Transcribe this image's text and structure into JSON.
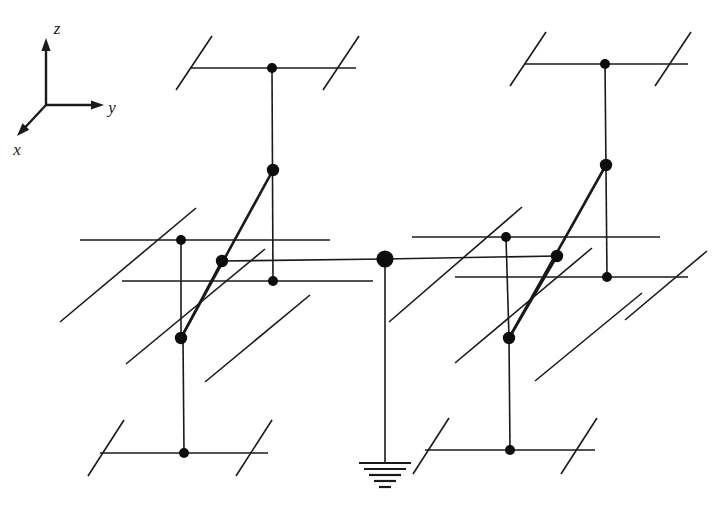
{
  "figure": {
    "kind": "crystal-lattice-diagram",
    "background_color": "#ffffff",
    "line_color": "#1a1a1a",
    "node_color": "#0d0d0d",
    "width": 723,
    "height": 508
  },
  "axes": {
    "origin": {
      "x": 46,
      "y": 105
    },
    "items": [
      {
        "name": "z",
        "label": "z",
        "tip": {
          "x": 46,
          "y": 38
        },
        "label_pos": {
          "x": 57,
          "y": 34
        }
      },
      {
        "name": "y",
        "label": "y",
        "tip": {
          "x": 104,
          "y": 105
        },
        "label_pos": {
          "x": 112,
          "y": 113
        }
      },
      {
        "name": "x",
        "label": "x",
        "tip": {
          "x": 17,
          "y": 136
        },
        "label_pos": {
          "x": 17,
          "y": 155
        }
      }
    ]
  },
  "geometry": {
    "stroke_thin": 1.6,
    "stroke_thick": 2.6,
    "node_radius_small": 5.0,
    "node_radius_medium": 6.2,
    "node_radius_large": 8.6,
    "nodes": [
      {
        "id": "n-top-left",
        "x": 272,
        "y": 68,
        "size": "small"
      },
      {
        "id": "n-top-right",
        "x": 605,
        "y": 64,
        "size": "small"
      },
      {
        "id": "n-upper-left-mid",
        "x": 273,
        "y": 170,
        "size": "medium"
      },
      {
        "id": "n-upper-right-mid",
        "x": 606,
        "y": 165,
        "size": "medium"
      },
      {
        "id": "n-left-outer",
        "x": 181,
        "y": 240,
        "size": "small"
      },
      {
        "id": "n-right-outer",
        "x": 506,
        "y": 237,
        "size": "small"
      },
      {
        "id": "n-left-inner",
        "x": 222,
        "y": 261,
        "size": "medium"
      },
      {
        "id": "n-right-inner",
        "x": 557,
        "y": 256,
        "size": "medium"
      },
      {
        "id": "n-left-low",
        "x": 273,
        "y": 281,
        "size": "small"
      },
      {
        "id": "n-right-low",
        "x": 607,
        "y": 277,
        "size": "small"
      },
      {
        "id": "n-left-base",
        "x": 181,
        "y": 338,
        "size": "medium"
      },
      {
        "id": "n-right-base",
        "x": 509,
        "y": 338,
        "size": "medium"
      },
      {
        "id": "n-bottom-left",
        "x": 184,
        "y": 453,
        "size": "small"
      },
      {
        "id": "n-bottom-right",
        "x": 510,
        "y": 450,
        "size": "small"
      },
      {
        "id": "n-center-ground",
        "x": 385,
        "y": 259,
        "size": "large"
      }
    ],
    "thin_segments": [
      {
        "id": "h-top-left",
        "x1": 190,
        "y1": 68,
        "x2": 356,
        "y2": 68
      },
      {
        "id": "h-top-right",
        "x1": 524,
        "y1": 64,
        "x2": 688,
        "y2": 64
      },
      {
        "id": "d-top-left-a",
        "x1": 176,
        "y1": 90,
        "x2": 212,
        "y2": 36
      },
      {
        "id": "d-top-left-b",
        "x1": 323,
        "y1": 90,
        "x2": 359,
        "y2": 36
      },
      {
        "id": "d-top-right-a",
        "x1": 510,
        "y1": 86,
        "x2": 546,
        "y2": 32
      },
      {
        "id": "d-top-right-b",
        "x1": 655,
        "y1": 86,
        "x2": 691,
        "y2": 32
      },
      {
        "id": "v-top-left-down",
        "x1": 272,
        "y1": 68,
        "x2": 273,
        "y2": 281
      },
      {
        "id": "v-top-right-down",
        "x1": 605,
        "y1": 64,
        "x2": 607,
        "y2": 277
      },
      {
        "id": "h-left-outer",
        "x1": 80,
        "y1": 240,
        "x2": 330,
        "y2": 240
      },
      {
        "id": "h-right-outer",
        "x1": 412,
        "y1": 237,
        "x2": 660,
        "y2": 237
      },
      {
        "id": "h-left-inner",
        "x1": 222,
        "y1": 261,
        "x2": 385,
        "y2": 259
      },
      {
        "id": "h-right-inner",
        "x1": 385,
        "y1": 259,
        "x2": 557,
        "y2": 256
      },
      {
        "id": "h-left-low",
        "x1": 122,
        "y1": 281,
        "x2": 373,
        "y2": 281
      },
      {
        "id": "h-right-low",
        "x1": 455,
        "y1": 277,
        "x2": 688,
        "y2": 277
      },
      {
        "id": "v-left-outer-down",
        "x1": 181,
        "y1": 240,
        "x2": 181,
        "y2": 338
      },
      {
        "id": "v-right-outer-down",
        "x1": 506,
        "y1": 237,
        "x2": 509,
        "y2": 338
      },
      {
        "id": "v-left-base-down",
        "x1": 183,
        "y1": 338,
        "x2": 184,
        "y2": 453
      },
      {
        "id": "v-right-base-down",
        "x1": 509,
        "y1": 338,
        "x2": 510,
        "y2": 450
      },
      {
        "id": "d-mid-left-a",
        "x1": 60,
        "y1": 322,
        "x2": 196,
        "y2": 208
      },
      {
        "id": "d-mid-left-b",
        "x1": 126,
        "y1": 364,
        "x2": 265,
        "y2": 249
      },
      {
        "id": "d-mid-left-c",
        "x1": 205,
        "y1": 382,
        "x2": 310,
        "y2": 295
      },
      {
        "id": "d-mid-right-a",
        "x1": 389,
        "y1": 322,
        "x2": 522,
        "y2": 207
      },
      {
        "id": "d-mid-right-b",
        "x1": 455,
        "y1": 363,
        "x2": 592,
        "y2": 248
      },
      {
        "id": "d-mid-right-c",
        "x1": 535,
        "y1": 381,
        "x2": 642,
        "y2": 293
      },
      {
        "id": "d-mid-far-right",
        "x1": 625,
        "y1": 320,
        "x2": 707,
        "y2": 251
      },
      {
        "id": "h-bottom-left",
        "x1": 100,
        "y1": 453,
        "x2": 268,
        "y2": 453
      },
      {
        "id": "h-bottom-right",
        "x1": 425,
        "y1": 450,
        "x2": 595,
        "y2": 450
      },
      {
        "id": "d-bottom-left-a",
        "x1": 88,
        "y1": 476,
        "x2": 124,
        "y2": 420
      },
      {
        "id": "d-bottom-left-b",
        "x1": 236,
        "y1": 476,
        "x2": 272,
        "y2": 420
      },
      {
        "id": "d-bottom-right-a",
        "x1": 413,
        "y1": 474,
        "x2": 449,
        "y2": 418
      },
      {
        "id": "d-bottom-right-b",
        "x1": 561,
        "y1": 474,
        "x2": 597,
        "y2": 418
      },
      {
        "id": "v-center-ground",
        "x1": 385,
        "y1": 259,
        "x2": 385,
        "y2": 463
      }
    ],
    "thick_segments": [
      {
        "id": "bond-left-upper",
        "x1": 181,
        "y1": 338,
        "x2": 273,
        "y2": 170
      },
      {
        "id": "bond-left-lower",
        "x1": 181,
        "y1": 338,
        "x2": 222,
        "y2": 261
      },
      {
        "id": "bond-right-upper",
        "x1": 509,
        "y1": 338,
        "x2": 606,
        "y2": 165
      },
      {
        "id": "bond-right-lower",
        "x1": 509,
        "y1": 338,
        "x2": 557,
        "y2": 256
      }
    ]
  },
  "ground_symbol": {
    "name": "earth-ground",
    "center_x": 385,
    "top_y": 463,
    "bars": [
      {
        "half_width": 26,
        "y": 463
      },
      {
        "half_width": 21,
        "y": 469
      },
      {
        "half_width": 16,
        "y": 475
      },
      {
        "half_width": 11,
        "y": 481
      },
      {
        "half_width": 6,
        "y": 487
      }
    ]
  }
}
